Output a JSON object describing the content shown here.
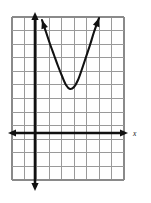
{
  "figure": {
    "background_color": "#ffffff",
    "width": 151,
    "height": 203
  },
  "grid": {
    "columns": 9,
    "rows": 12,
    "line_color": "#9a9a9a",
    "left": 12,
    "right": 124,
    "top": 17,
    "bottom": 180,
    "cell_width": 12.44,
    "cell_height": 13.58
  },
  "axes": {
    "color": "#111111",
    "x_axis": {
      "label": "x",
      "label_x": 133,
      "label_y": 136,
      "pixel_y": 133,
      "start_x": 8,
      "end_x": 128,
      "arrows": "both"
    },
    "y_axis": {
      "label": "",
      "pixel_x": 35,
      "start_y": 12,
      "end_y": 191,
      "arrows": "both"
    },
    "origin": {
      "x": 35,
      "y": 133
    }
  },
  "chart_data": {
    "type": "line",
    "xlabel": "x",
    "ylabel": "",
    "grid": true,
    "legend": false,
    "series": [
      {
        "name": "parabola",
        "shape": "parabola-opening-up",
        "vertex": {
          "x_px": 70,
          "y_px": 89
        },
        "arrow_ends": [
          "left-top",
          "right-top"
        ],
        "points_px": [
          {
            "x": 42,
            "y": 20
          },
          {
            "x": 46,
            "y": 32
          },
          {
            "x": 50,
            "y": 44
          },
          {
            "x": 54,
            "y": 55
          },
          {
            "x": 58,
            "y": 66
          },
          {
            "x": 62,
            "y": 76
          },
          {
            "x": 66,
            "y": 85
          },
          {
            "x": 70,
            "y": 89
          },
          {
            "x": 74,
            "y": 87
          },
          {
            "x": 78,
            "y": 80
          },
          {
            "x": 82,
            "y": 69
          },
          {
            "x": 86,
            "y": 57
          },
          {
            "x": 90,
            "y": 45
          },
          {
            "x": 94,
            "y": 32
          },
          {
            "x": 99,
            "y": 18
          }
        ]
      }
    ],
    "axis_units": {
      "vertex_grid_x": 2.8,
      "vertex_grid_y": 3.2,
      "note": "vertex located right of y-axis and above x-axis"
    }
  }
}
